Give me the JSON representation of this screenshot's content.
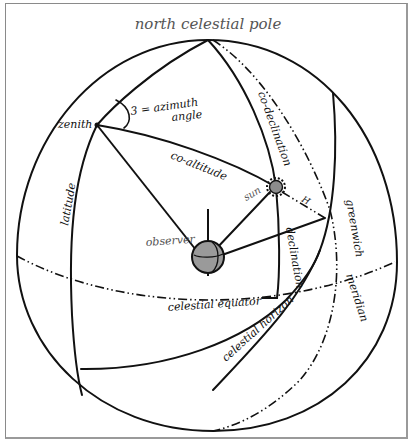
{
  "diagram": {
    "title": "north celestial pole",
    "colors": {
      "ink": "#111111",
      "title_ink": "#555555",
      "observer_fill": "#9a9a9a",
      "sun_fill": "#8c8c8c",
      "frame": "#8a8a8a",
      "background": "#ffffff"
    },
    "labels": {
      "zenith": "zenith",
      "azimuth_line1": "3 = azimuth",
      "azimuth_line2": "angle",
      "co_altitude": "co-altitude",
      "co_declination": "co-declination",
      "latitude": "latitude",
      "sun": "sun",
      "H": "H",
      "observer": "observer",
      "declination": "declination",
      "greenwich": "greenwich",
      "meridian": "meridian",
      "celestial_equator": "celestial equator",
      "celestial_horizon": "celestial horizon"
    },
    "points": {
      "north_pole": [
        208,
        40
      ],
      "zenith": [
        97,
        125
      ],
      "observer": [
        208,
        257
      ],
      "sun": [
        276,
        187
      ],
      "hour_point": [
        325,
        218
      ]
    },
    "icons": [
      "observer-globe-icon",
      "sun-icon"
    ]
  }
}
